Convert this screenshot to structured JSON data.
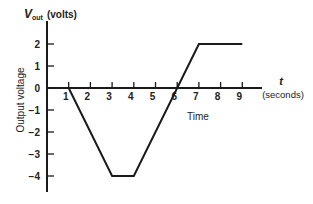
{
  "chart_data": {
    "type": "line",
    "title": "",
    "ylabel_top": "V",
    "ylabel_sub": "out",
    "ylabel_unit": "(volts)",
    "ylabel_side": "Output voltage",
    "xlabel_var": "t",
    "xlabel_unit": "(seconds)",
    "xlabel": "Time",
    "x_ticks": [
      1,
      2,
      3,
      4,
      5,
      6,
      7,
      8,
      9
    ],
    "y_ticks": [
      2,
      1,
      0,
      -1,
      -2,
      -3,
      -4
    ],
    "y_tick_labels": [
      "2",
      "1",
      "0",
      "−1",
      "−2",
      "−3",
      "−4"
    ],
    "xlim": [
      0,
      9.9
    ],
    "ylim": [
      -4.7,
      2.9
    ],
    "grid": false,
    "legend": null,
    "series": [
      {
        "name": "Vout",
        "x": [
          0,
          1,
          3,
          4,
          7,
          9
        ],
        "y": [
          0,
          0,
          -4,
          -4,
          2,
          2
        ]
      }
    ]
  }
}
